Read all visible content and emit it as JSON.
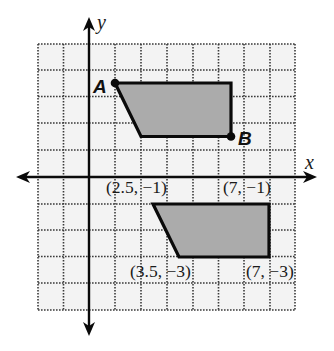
{
  "diagram": {
    "type": "coordinate-grid",
    "axes": {
      "x_label": "x",
      "y_label": "y"
    },
    "grid": {
      "x_min": -2,
      "x_max": 8,
      "y_min": -5,
      "y_max": 5,
      "step": 1
    },
    "colors": {
      "shape_fill": "#ababab",
      "grid_fill": "#f3f3f3",
      "grid_line": "#333333",
      "stroke": "#0a0a0a"
    },
    "shapes": [
      {
        "name": "original",
        "vertices": [
          [
            1,
            3.5
          ],
          [
            5.5,
            3.5
          ],
          [
            5.5,
            1.5
          ],
          [
            2,
            1.5
          ]
        ],
        "point_labels": [
          {
            "text": "A",
            "at": [
              1,
              3.5
            ]
          },
          {
            "text": "B",
            "at": [
              5.5,
              1.5
            ]
          }
        ]
      },
      {
        "name": "image",
        "vertices": [
          [
            2.5,
            -1
          ],
          [
            7,
            -1
          ],
          [
            7,
            -3
          ],
          [
            3.5,
            -3
          ]
        ],
        "coordinate_labels": [
          {
            "text": "(2.5, −1)"
          },
          {
            "text": "(7, −1)"
          },
          {
            "text": "(3.5, −3)"
          },
          {
            "text": "(7, −3)"
          }
        ]
      }
    ]
  }
}
